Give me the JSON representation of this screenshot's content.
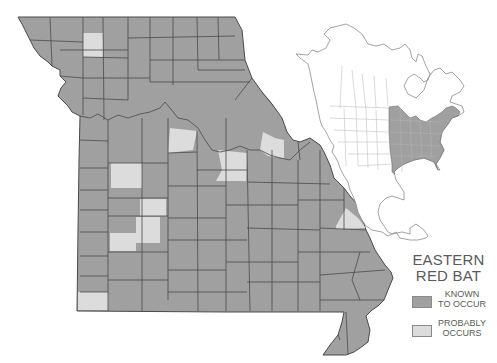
{
  "title": "EASTERN RED BAT",
  "title_lines": [
    "EASTERN",
    "RED BAT"
  ],
  "legend": {
    "items": [
      {
        "label": "KNOWN TO OCCUR",
        "lines": [
          "KNOWN",
          "TO OCCUR"
        ],
        "color": "#a0a0a0"
      },
      {
        "label": "PROBABLY OCCURS",
        "lines": [
          "PROBABLY",
          "OCCURS"
        ],
        "color": "#dcdcdc"
      }
    ]
  },
  "colors": {
    "known": "#a0a0a0",
    "probable": "#dcdcdc",
    "border": "#4a4a4a",
    "inset_outline": "#8c8c8c",
    "inset_range": "#a0a0a0"
  },
  "map": {
    "region": "Missouri counties",
    "inset": "North America range map"
  }
}
